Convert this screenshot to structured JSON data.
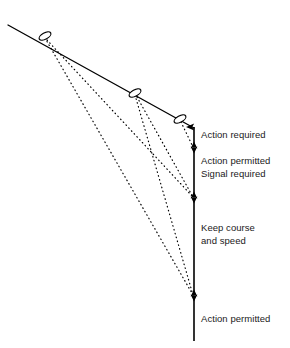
{
  "diagram": {
    "type": "navigation-rules-schematic",
    "canvas": {
      "width": 290,
      "height": 348,
      "background": "#ffffff"
    },
    "colors": {
      "line": "#000000",
      "text": "#1a1a1a",
      "background": "#ffffff"
    },
    "track": {
      "name": "approach-track",
      "style": "solid",
      "start": {
        "x": 8,
        "y": 25
      },
      "end": {
        "x": 194,
        "y": 128
      }
    },
    "vessel_markers": [
      {
        "id": "vessel-1",
        "x": 45,
        "y": 36,
        "rx": 6.5,
        "ry": 3.2,
        "angle": -29
      },
      {
        "id": "vessel-2",
        "x": 135,
        "y": 93,
        "rx": 6.5,
        "ry": 3.2,
        "angle": -29
      },
      {
        "id": "vessel-3",
        "x": 180,
        "y": 119,
        "rx": 6.5,
        "ry": 3.2,
        "angle": -29
      }
    ],
    "bearing_lines": [
      {
        "id": "bearing-1",
        "style": "dotted",
        "from": {
          "x": 47,
          "y": 40
        },
        "to": {
          "x": 193,
          "y": 197
        }
      },
      {
        "id": "bearing-2",
        "style": "dotted",
        "from": {
          "x": 45,
          "y": 38
        },
        "to": {
          "x": 193,
          "y": 295
        }
      },
      {
        "id": "bearing-3",
        "style": "dotted",
        "from": {
          "x": 137,
          "y": 97
        },
        "to": {
          "x": 193,
          "y": 197
        }
      },
      {
        "id": "bearing-4",
        "style": "dotted",
        "from": {
          "x": 135,
          "y": 95
        },
        "to": {
          "x": 193,
          "y": 295
        }
      },
      {
        "id": "bearing-5",
        "style": "dotted",
        "from": {
          "x": 181,
          "y": 122
        },
        "to": {
          "x": 193,
          "y": 147
        }
      }
    ],
    "axis": {
      "name": "zone-axis",
      "x": 194,
      "top": 126,
      "bottom": 341,
      "arrow_top": true,
      "dividers": [
        147,
        197,
        295
      ]
    },
    "zones": [
      {
        "id": "zone-action-required",
        "top": 128,
        "bottom": 147,
        "lines": [
          "Action required"
        ]
      },
      {
        "id": "zone-action-permitted-signal-required",
        "top": 147,
        "bottom": 197,
        "lines": [
          "Action permitted",
          "Signal required"
        ]
      },
      {
        "id": "zone-keep-course-and-speed",
        "top": 197,
        "bottom": 295,
        "lines": [
          "Keep course",
          "and speed"
        ]
      },
      {
        "id": "zone-action-permitted",
        "top": 295,
        "bottom": 341,
        "lines": [
          "Action permitted"
        ]
      }
    ]
  }
}
